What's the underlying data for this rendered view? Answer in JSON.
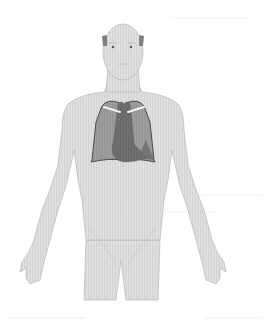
{
  "figure": {
    "highlighted_organs": [
      "lungs",
      "heart"
    ],
    "colors": {
      "background": "#ffffff",
      "body_fill": "#e2e2e2",
      "body_hatch": "#cfcfcf",
      "body_outline": "#b5b5b5",
      "lung_fill": "#9c9c9c",
      "lung_outline": "#4a4a4a",
      "heart_fill": "#6e6e6e",
      "heart_dark": "#5c5c5c",
      "clavicle": "#f2f2f2",
      "hair": "#7a7a7a",
      "leader_line": "#e4e4e4"
    }
  }
}
